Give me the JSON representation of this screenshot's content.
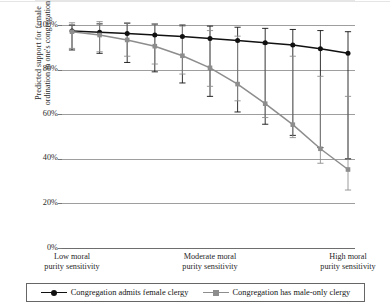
{
  "figure": {
    "y_axis_title_line1": "Predicted support for female",
    "y_axis_title_line2": "ordination in one's congregation"
  },
  "legend": {
    "items": [
      {
        "label": "Congregation admits female clergy",
        "color": "#111111",
        "marker": "circle"
      },
      {
        "label": "Congregation has male-only clergy",
        "color": "#8d8d8d",
        "marker": "square"
      }
    ]
  },
  "chart_data": {
    "type": "line",
    "title": "",
    "xlabel": "",
    "ylabel": "Predicted support for female ordination in one's congregation",
    "ylim": [
      0,
      100
    ],
    "yticks": [
      0,
      20,
      40,
      60,
      80,
      100
    ],
    "ytick_labels": [
      "0%",
      "20%",
      "40%",
      "60%",
      "80%",
      "100%"
    ],
    "grid": true,
    "legend_position": "bottom",
    "x": [
      1,
      2,
      3,
      4,
      5,
      6,
      7,
      8,
      9,
      10,
      11
    ],
    "x_category_labels": [
      {
        "index": 1,
        "text": "Low moral\npurity sensitivity"
      },
      {
        "index": 6,
        "text": "Moderate moral\npurity sensitivity"
      },
      {
        "index": 11,
        "text": "High moral\npurity sensitivity"
      }
    ],
    "series": [
      {
        "name": "Congregation admits female clergy",
        "color": "#111111",
        "marker": "circle",
        "values": [
          97.3,
          96.8,
          96.2,
          95.5,
          94.8,
          94.0,
          93.0,
          92.0,
          91.0,
          89.3,
          87.3
        ],
        "error_low": [
          88.8,
          87.3,
          83.2,
          79.0,
          74.0,
          68.0,
          61.0,
          55.5,
          50.5,
          45.0,
          40.0
        ],
        "error_high": [
          100.0,
          100.5,
          100.8,
          100.4,
          100.0,
          99.5,
          99.0,
          98.5,
          98.0,
          97.5,
          97.0
        ]
      },
      {
        "name": "Congregation has male-only clergy",
        "color": "#8d8d8d",
        "marker": "square",
        "values": [
          97.0,
          95.5,
          93.3,
          90.5,
          86.2,
          80.8,
          73.5,
          64.7,
          55.3,
          44.5,
          35.2
        ],
        "error_low": [
          89.5,
          88.0,
          86.0,
          82.5,
          78.0,
          72.5,
          66.0,
          58.5,
          49.5,
          38.0,
          26.0
        ],
        "error_high": [
          101.0,
          101.5,
          101.0,
          100.5,
          99.5,
          97.5,
          95.0,
          91.5,
          86.0,
          77.0,
          68.0
        ]
      }
    ]
  }
}
